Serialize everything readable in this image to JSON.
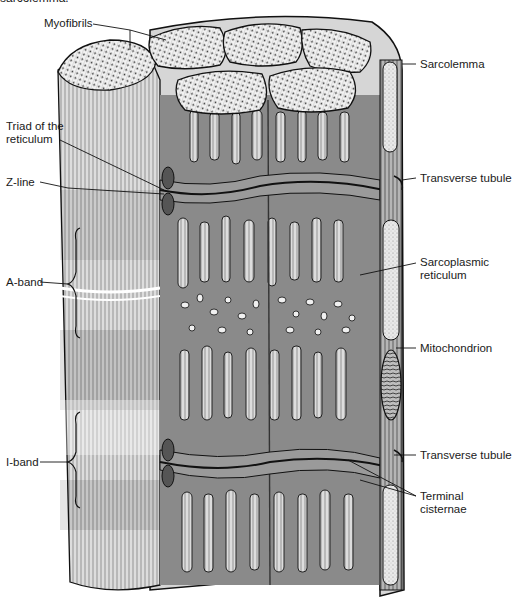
{
  "caption": {
    "clipped_text": "sarcolemma."
  },
  "diagram": {
    "labels_left": [
      {
        "id": "myofibrils",
        "text": "Myofibrils"
      },
      {
        "id": "triad",
        "line1": "Triad of the",
        "line2": "reticulum"
      },
      {
        "id": "z-line",
        "text": "Z-line"
      },
      {
        "id": "a-band",
        "text": "A-band"
      },
      {
        "id": "i-band",
        "text": "I-band"
      }
    ],
    "labels_right": [
      {
        "id": "sarcolemma",
        "text": "Sarcolemma"
      },
      {
        "id": "transverse-tubule-upper",
        "text": "Transverse tubule"
      },
      {
        "id": "sarcoplasmic-reticulum",
        "line1": "Sarcoplasmic",
        "line2": "reticulum"
      },
      {
        "id": "mitochondrion",
        "text": "Mitochondrion"
      },
      {
        "id": "transverse-tubule-lower",
        "text": "Transverse tubule"
      },
      {
        "id": "terminal-cisternae",
        "line1": "Terminal",
        "line2": "cisternae"
      }
    ],
    "colors": {
      "reticulum_fill": "#8a8a8a",
      "fibril_light": "#e8e8e8",
      "line": "#111111",
      "background": "#ffffff"
    }
  }
}
